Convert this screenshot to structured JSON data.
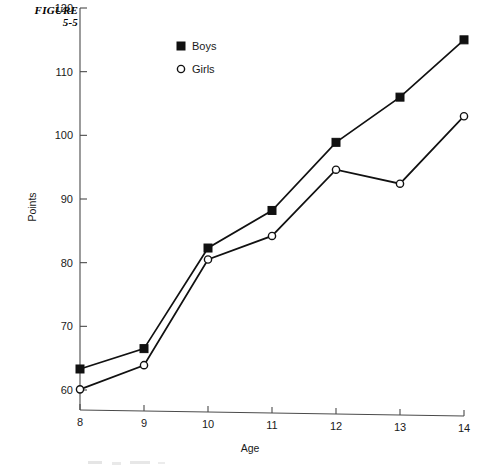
{
  "figure": {
    "label_line1": "FIGURE",
    "label_line2": "5-5"
  },
  "legend": {
    "position": "inside-top-left",
    "entries": [
      {
        "label": "Boys",
        "marker": "filled-square-marker",
        "color": "#111111"
      },
      {
        "label": "Girls",
        "marker": "open-circle-marker",
        "color": "#111111"
      }
    ]
  },
  "chart_data": {
    "type": "line",
    "title": "",
    "subtitle": "",
    "xlabel": "Age",
    "ylabel": "Points",
    "x": [
      8,
      9,
      10,
      11,
      12,
      13,
      14
    ],
    "xticklabels": [
      "8",
      "9",
      "10",
      "11",
      "12",
      "13",
      "14"
    ],
    "xlim": [
      8,
      14
    ],
    "ylim": [
      60,
      120
    ],
    "yticks": [
      60,
      70,
      80,
      90,
      100,
      110,
      120
    ],
    "yticklabels": [
      "60",
      "70",
      "80",
      "90",
      "100",
      "110",
      "120"
    ],
    "grid": false,
    "legend_position": "upper left inside",
    "series": [
      {
        "name": "Boys",
        "marker": "filled-square",
        "color": "#111111",
        "values": [
          63.3,
          66.5,
          82.3,
          88.2,
          98.9,
          106.0,
          115.0
        ]
      },
      {
        "name": "Girls",
        "marker": "open-circle",
        "color": "#111111",
        "values": [
          60.1,
          63.9,
          80.5,
          84.2,
          94.6,
          92.4,
          103.0
        ]
      }
    ],
    "annotations": []
  }
}
